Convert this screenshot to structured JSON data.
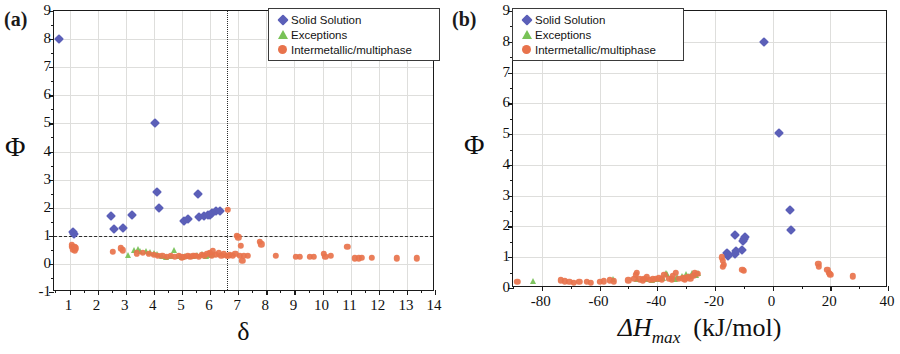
{
  "figure": {
    "panel_a_tag": "(a)",
    "panel_b_tag": "(b)"
  },
  "legend": {
    "items": [
      {
        "label": "Solid Solution",
        "marker": "diamond",
        "color": "#5b5fb8",
        "icon": "diamond-marker-icon"
      },
      {
        "label": "Exceptions",
        "marker": "triangle",
        "color": "#78c257",
        "icon": "triangle-marker-icon"
      },
      {
        "label": "Intermetallic/multiphase",
        "marker": "circle",
        "color": "#e8734c",
        "icon": "circle-marker-icon"
      }
    ]
  },
  "chart_data": [
    {
      "type": "scatter",
      "panel": "(a)",
      "title": "",
      "xlabel": "δ",
      "ylabel": "Φ",
      "xlim": [
        0.45,
        14
      ],
      "ylim": [
        -1,
        9
      ],
      "xticks": [
        1,
        2,
        3,
        4,
        5,
        6,
        7,
        8,
        9,
        10,
        11,
        12,
        13,
        14
      ],
      "yticks": [
        -1,
        0,
        1,
        2,
        3,
        4,
        5,
        6,
        7,
        8,
        9
      ],
      "xtick_labels": [
        "1",
        "2",
        "3",
        "4",
        "5",
        "6",
        "7",
        "8",
        "9",
        "10",
        "11",
        "12",
        "13",
        "14"
      ],
      "ytick_labels": [
        "-1",
        "0",
        "1",
        "2",
        "3",
        "4",
        "5",
        "6",
        "7",
        "8",
        "9"
      ],
      "grid": true,
      "legend_position": "top-right",
      "annotations": [
        {
          "kind": "hline",
          "value": 1,
          "style": "dashed",
          "label": "Φ = 1"
        },
        {
          "kind": "vline",
          "value": 6.6,
          "style": "dotted",
          "label": "δ = 6.6"
        }
      ],
      "series": [
        {
          "name": "Solid Solution",
          "color": "#5b5fb8",
          "marker": "diamond",
          "points": [
            [
              0.62,
              8.0
            ],
            [
              1.12,
              1.14
            ],
            [
              1.15,
              1.05
            ],
            [
              2.48,
              1.72
            ],
            [
              2.58,
              1.26
            ],
            [
              2.9,
              1.27
            ],
            [
              3.22,
              1.75
            ],
            [
              4.05,
              5.03
            ],
            [
              4.12,
              2.56
            ],
            [
              4.2,
              1.98
            ],
            [
              5.08,
              1.53
            ],
            [
              5.2,
              1.6
            ],
            [
              5.58,
              2.5
            ],
            [
              5.6,
              1.68
            ],
            [
              5.78,
              1.72
            ],
            [
              5.92,
              1.73
            ],
            [
              6.0,
              1.75
            ],
            [
              6.08,
              1.82
            ],
            [
              6.2,
              1.9
            ],
            [
              6.35,
              1.88
            ]
          ]
        },
        {
          "name": "Exceptions",
          "color": "#78c257",
          "marker": "triangle",
          "points": [
            [
              3.08,
              0.32
            ],
            [
              3.3,
              0.5
            ],
            [
              3.42,
              0.52
            ],
            [
              3.5,
              0.46
            ],
            [
              3.72,
              0.45
            ],
            [
              3.88,
              0.42
            ],
            [
              4.0,
              0.4
            ],
            [
              4.12,
              0.37
            ],
            [
              4.3,
              0.3
            ],
            [
              4.42,
              0.26
            ],
            [
              4.6,
              0.3
            ],
            [
              4.72,
              0.48
            ],
            [
              4.88,
              0.3
            ],
            [
              5.0,
              0.25
            ],
            [
              5.12,
              0.27
            ],
            [
              5.28,
              0.3
            ],
            [
              5.4,
              0.28
            ],
            [
              5.55,
              0.32
            ],
            [
              5.7,
              0.35
            ],
            [
              5.85,
              0.3
            ],
            [
              6.0,
              0.33
            ],
            [
              6.12,
              0.36
            ]
          ]
        },
        {
          "name": "Intermetallic/multiphase",
          "color": "#e8734c",
          "marker": "circle",
          "points": [
            [
              1.08,
              0.68
            ],
            [
              1.1,
              0.6
            ],
            [
              1.12,
              0.52
            ],
            [
              1.15,
              0.58
            ],
            [
              1.18,
              0.48
            ],
            [
              1.2,
              0.62
            ],
            [
              1.22,
              0.55
            ],
            [
              2.55,
              0.42
            ],
            [
              2.82,
              0.55
            ],
            [
              2.9,
              0.48
            ],
            [
              3.4,
              0.38
            ],
            [
              3.6,
              0.4
            ],
            [
              3.82,
              0.35
            ],
            [
              4.0,
              0.33
            ],
            [
              4.15,
              0.28
            ],
            [
              4.3,
              0.3
            ],
            [
              4.45,
              0.26
            ],
            [
              4.6,
              0.29
            ],
            [
              4.75,
              0.25
            ],
            [
              4.9,
              0.28
            ],
            [
              5.0,
              0.24
            ],
            [
              5.1,
              0.26
            ],
            [
              5.2,
              0.3
            ],
            [
              5.3,
              0.25
            ],
            [
              5.4,
              0.28
            ],
            [
              5.5,
              0.3
            ],
            [
              5.6,
              0.26
            ],
            [
              5.7,
              0.33
            ],
            [
              5.8,
              0.3
            ],
            [
              5.9,
              0.36
            ],
            [
              6.0,
              0.4
            ],
            [
              6.05,
              0.3
            ],
            [
              6.1,
              0.45
            ],
            [
              6.2,
              0.32
            ],
            [
              6.3,
              0.38
            ],
            [
              6.4,
              0.3
            ],
            [
              6.5,
              0.34
            ],
            [
              6.6,
              0.3
            ],
            [
              6.62,
              1.92
            ],
            [
              6.65,
              0.28
            ],
            [
              6.7,
              0.32
            ],
            [
              6.8,
              0.3
            ],
            [
              6.9,
              0.35
            ],
            [
              6.95,
              1.0
            ],
            [
              7.0,
              0.95
            ],
            [
              7.05,
              0.3
            ],
            [
              7.1,
              0.65
            ],
            [
              7.15,
              0.1
            ],
            [
              7.2,
              0.3
            ],
            [
              7.35,
              0.28
            ],
            [
              7.78,
              0.78
            ],
            [
              7.82,
              0.7
            ],
            [
              8.35,
              0.28
            ],
            [
              9.05,
              0.26
            ],
            [
              9.2,
              0.25
            ],
            [
              9.55,
              0.25
            ],
            [
              9.7,
              0.26
            ],
            [
              10.05,
              0.35
            ],
            [
              10.1,
              0.25
            ],
            [
              10.3,
              0.3
            ],
            [
              10.88,
              0.62
            ],
            [
              11.15,
              0.2
            ],
            [
              11.3,
              0.2
            ],
            [
              11.4,
              0.22
            ],
            [
              11.75,
              0.22
            ],
            [
              12.65,
              0.2
            ],
            [
              13.35,
              0.2
            ]
          ]
        }
      ]
    },
    {
      "type": "scatter",
      "panel": "(b)",
      "title": "",
      "xlabel": "ΔH_max (kJ/mol)",
      "ylabel": "Φ",
      "xlim": [
        -90,
        40
      ],
      "ylim": [
        0,
        9
      ],
      "xticks": [
        -80,
        -60,
        -40,
        -20,
        0,
        20,
        40
      ],
      "yticks": [
        0,
        1,
        2,
        3,
        4,
        5,
        6,
        7,
        8,
        9
      ],
      "xtick_labels": [
        "-80",
        "-60",
        "-40",
        "-20",
        "0",
        "20",
        "40"
      ],
      "ytick_labels": [
        "0",
        "1",
        "2",
        "3",
        "4",
        "5",
        "6",
        "7",
        "8",
        "9"
      ],
      "grid": true,
      "legend_position": "top-left",
      "series": [
        {
          "name": "Solid Solution",
          "color": "#5b5fb8",
          "marker": "diamond",
          "points": [
            [
              -3.0,
              8.0
            ],
            [
              2.2,
              5.03
            ],
            [
              6.0,
              2.52
            ],
            [
              6.2,
              1.9
            ],
            [
              -13.2,
              1.72
            ],
            [
              -10.0,
              1.6
            ],
            [
              -9.6,
              1.66
            ],
            [
              -10.2,
              1.52
            ],
            [
              -12.6,
              1.2
            ],
            [
              -13.0,
              1.12
            ],
            [
              -10.5,
              1.24
            ],
            [
              -15.5,
              1.05
            ],
            [
              -16.0,
              1.14
            ]
          ]
        },
        {
          "name": "Exceptions",
          "color": "#78c257",
          "marker": "triangle",
          "points": [
            [
              -83.0,
              0.22
            ],
            [
              -55.5,
              0.3
            ],
            [
              -47.0,
              0.28
            ],
            [
              -44.0,
              0.3
            ],
            [
              -42.0,
              0.26
            ],
            [
              -40.0,
              0.3
            ],
            [
              -38.0,
              0.34
            ],
            [
              -36.5,
              0.45
            ],
            [
              -35.0,
              0.32
            ],
            [
              -33.0,
              0.35
            ],
            [
              -31.5,
              0.4
            ],
            [
              -30.0,
              0.45
            ],
            [
              -29.0,
              0.4
            ],
            [
              -28.0,
              0.5
            ],
            [
              -27.0,
              0.45
            ],
            [
              -26.5,
              0.42
            ],
            [
              -26.0,
              0.5
            ],
            [
              -37.0,
              0.5
            ],
            [
              -34.0,
              0.3
            ]
          ]
        },
        {
          "name": "Intermetallic/multiphase",
          "color": "#e8734c",
          "marker": "circle",
          "points": [
            [
              -88.5,
              0.2
            ],
            [
              -73.5,
              0.25
            ],
            [
              -72.0,
              0.22
            ],
            [
              -70.5,
              0.2
            ],
            [
              -69.0,
              0.18
            ],
            [
              -67.0,
              0.2
            ],
            [
              -64.5,
              0.2
            ],
            [
              -63.0,
              0.18
            ],
            [
              -60.0,
              0.2
            ],
            [
              -58.5,
              0.22
            ],
            [
              -56.5,
              0.25
            ],
            [
              -55.0,
              0.22
            ],
            [
              -50.0,
              0.25
            ],
            [
              -48.0,
              0.3
            ],
            [
              -47.5,
              0.42
            ],
            [
              -47.0,
              0.5
            ],
            [
              -46.0,
              0.28
            ],
            [
              -45.0,
              0.25
            ],
            [
              -44.5,
              0.3
            ],
            [
              -43.5,
              0.35
            ],
            [
              -42.5,
              0.26
            ],
            [
              -41.5,
              0.28
            ],
            [
              -40.5,
              0.3
            ],
            [
              -39.5,
              0.32
            ],
            [
              -38.5,
              0.28
            ],
            [
              -37.5,
              0.42
            ],
            [
              -36.0,
              0.3
            ],
            [
              -35.0,
              0.28
            ],
            [
              -34.5,
              0.4
            ],
            [
              -33.5,
              0.5
            ],
            [
              -32.5,
              0.3
            ],
            [
              -31.0,
              0.32
            ],
            [
              -30.5,
              0.28
            ],
            [
              -29.5,
              0.35
            ],
            [
              -28.5,
              0.3
            ],
            [
              -27.5,
              0.4
            ],
            [
              -27.0,
              0.5
            ],
            [
              -26.0,
              0.45
            ],
            [
              -17.5,
              1.0
            ],
            [
              -17.2,
              0.88
            ],
            [
              -17.0,
              0.75
            ],
            [
              -17.3,
              0.7
            ],
            [
              -10.5,
              0.6
            ],
            [
              -10.0,
              0.55
            ],
            [
              15.8,
              0.78
            ],
            [
              16.0,
              0.7
            ],
            [
              19.0,
              0.6
            ],
            [
              19.5,
              0.5
            ],
            [
              19.8,
              0.45
            ],
            [
              20.0,
              0.42
            ],
            [
              27.8,
              0.38
            ]
          ]
        }
      ]
    }
  ]
}
